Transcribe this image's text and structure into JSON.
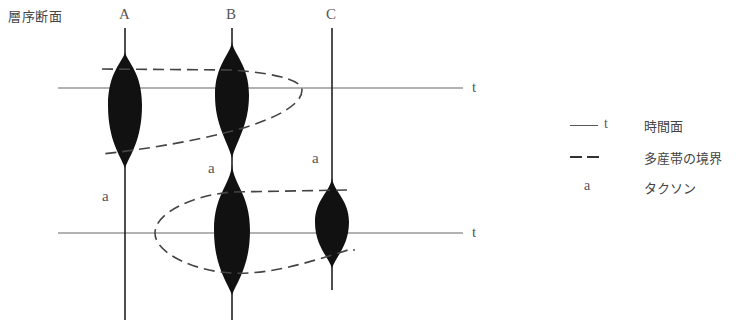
{
  "figure": {
    "title": "層序断面",
    "sections": [
      {
        "id": "A",
        "label": "A",
        "x": 125
      },
      {
        "id": "B",
        "label": "B",
        "x": 232
      },
      {
        "id": "C",
        "label": "C",
        "x": 332
      }
    ],
    "time_planes": [
      {
        "id": "t1",
        "label": "t",
        "y": 88
      },
      {
        "id": "t2",
        "label": "t",
        "y": 233
      }
    ],
    "taxon_labels": [
      {
        "label": "a",
        "section": "A",
        "x": 103,
        "y": 190
      },
      {
        "label": "a",
        "section": "B",
        "x": 210,
        "y": 160
      },
      {
        "label": "a",
        "section": "C",
        "x": 312,
        "y": 150
      }
    ],
    "acme_zones": [
      {
        "section": "A",
        "top": 55,
        "bottom": 165,
        "max_half_width": 17,
        "peak_y": 108
      },
      {
        "section": "B",
        "top": 45,
        "bottom": 155,
        "max_half_width": 17,
        "peak_y": 98
      },
      {
        "section": "B",
        "top": 168,
        "bottom": 290,
        "max_half_width": 18,
        "peak_y": 232
      },
      {
        "section": "C",
        "top": 180,
        "bottom": 265,
        "max_half_width": 17,
        "peak_y": 222
      }
    ],
    "boundaries": [
      {
        "id": "upper-boundary",
        "description": "Upper multi-production zone boundary (open to left, closes right at x≈302)"
      },
      {
        "id": "lower-boundary",
        "description": "Lower multi-production zone boundary (closes left at x≈155, open to right)"
      }
    ]
  },
  "legend": {
    "items": [
      {
        "symbol": "t",
        "symbol_type": "solid-line",
        "label": "時間面"
      },
      {
        "symbol": "",
        "symbol_type": "dashed-line",
        "label": "多産帯の境界"
      },
      {
        "symbol": "a",
        "symbol_type": "letter",
        "label": "タクソン"
      }
    ]
  },
  "colors": {
    "ink": "#111111",
    "line": "#555555",
    "dash": "#444444",
    "text": "#555555"
  }
}
